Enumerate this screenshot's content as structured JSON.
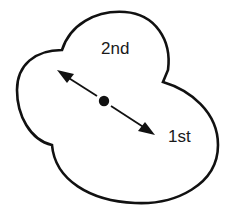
{
  "diagram": {
    "labels": {
      "second": "2nd",
      "first": "1st"
    },
    "colors": {
      "stroke": "#111111",
      "fill": "#ffffff",
      "text": "#1a1a1a"
    },
    "elements": [
      "lobed-outline",
      "double-headed-arrow",
      "center-dot"
    ]
  }
}
